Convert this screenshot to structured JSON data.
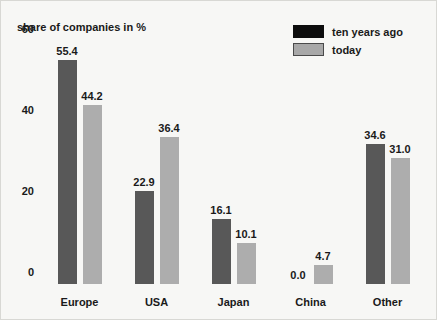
{
  "chart_data": {
    "type": "bar",
    "title": "share of companies in %",
    "xlabel": "",
    "ylabel": "share of companies in %",
    "ylim": [
      0,
      60
    ],
    "yticks": [
      0,
      20,
      40,
      60
    ],
    "ytick_labels": [
      "0",
      "20",
      "40",
      "60"
    ],
    "grid": false,
    "legend_position": "top-right",
    "categories": [
      "Europe",
      "USA",
      "Japan",
      "China",
      "Other"
    ],
    "series": [
      {
        "name": "ten years ago",
        "color": "#585858",
        "legend_color": "#0d0d0d",
        "values": [
          55.4,
          22.9,
          16.1,
          0.0,
          34.6
        ],
        "labels": [
          "55.4",
          "22.9",
          "16.1",
          "0.0",
          "34.6"
        ]
      },
      {
        "name": "today",
        "color": "#adadad",
        "legend_color": "#a8a8a8",
        "values": [
          44.2,
          36.4,
          10.1,
          4.7,
          31.0
        ],
        "labels": [
          "44.2",
          "36.4",
          "10.1",
          "4.7",
          "31.0"
        ]
      }
    ]
  }
}
